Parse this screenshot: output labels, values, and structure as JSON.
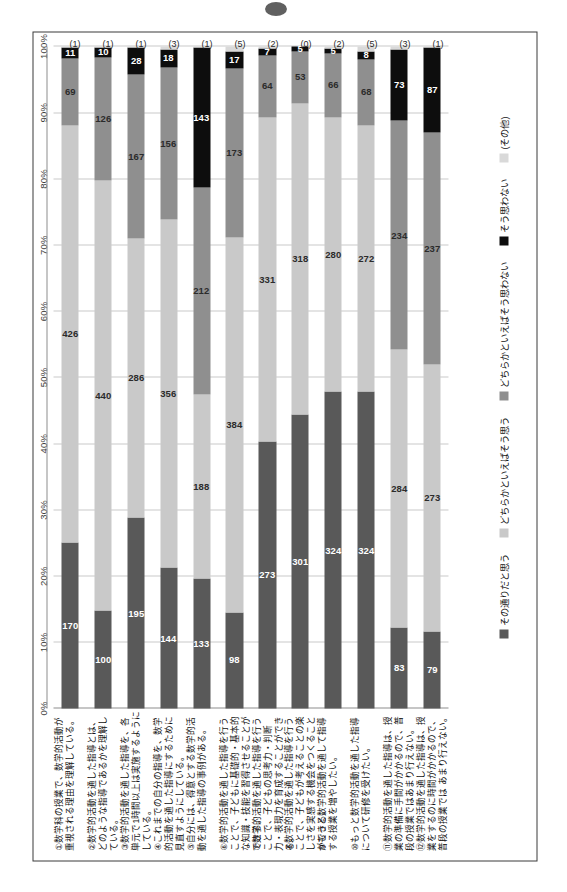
{
  "page": {
    "artifact": "punch-hole-mark"
  },
  "chart_data": {
    "type": "bar",
    "orientation": "horizontal-stacked-100",
    "title": "",
    "subtitle": "",
    "xlabel": "",
    "ylabel": "",
    "grid": true,
    "legend_position": "bottom",
    "xlim": [
      0,
      100
    ],
    "xticks": [
      "0%",
      "10%",
      "20%",
      "30%",
      "40%",
      "50%",
      "60%",
      "70%",
      "80%",
      "90%",
      "100%"
    ],
    "series": [
      {
        "name": "その通りだと思う",
        "color": "#595959"
      },
      {
        "name": "どちらかといえばそう思う",
        "color": "#c9c9c9"
      },
      {
        "name": "どちらかといえばそう思わない",
        "color": "#8f8f8f"
      },
      {
        "name": "そう思わない",
        "color": "#0d0d0d"
      },
      {
        "name": "(その他)",
        "color": "#d9d9d9"
      }
    ],
    "categories": [
      "①数学科の授業で、数学的活動が重視される理由を理解している。",
      "②数学的活動を通した指導とは、どのような指導であるかを理解している。",
      "③数学的活動を通した指導を、各単元で1時間以上は実施するようにしている。",
      "④これまでの自分の指導を、数学的活動を通した指導にするために見直すようにしている。",
      "⑤自分には、得意とする数学的活動を通した指導の事例がある。",
      "⑥数学的活動を通した指導を行うことで、子どもに基礎的・基本的な知識・技能を習得させることができる。",
      "⑦数学的活動を通した指導を行うことで、子どもの思考力・判断力・表現力を育成することができる。",
      "⑧数学的活動を通した指導を行うことで、子どもが考えることの楽しさを実感する機会をつくることができる。",
      "⑨もっと数学的活動を通して指導する授業を増やしたい。",
      "⑩もっと数学的活動を通した指導について研修を受けたい。",
      "⑪数学的活動を通した指導は、授業の準備に手間がかかるので、普段の授業ではあまり行えない。",
      "⑫数学的活動を通した指導は、授業をするのに時間がかかるので、普段の授業では あまり行えない。"
    ],
    "rows": [
      {
        "values": [
          170,
          426,
          69,
          11,
          1
        ],
        "other_label": "(1)"
      },
      {
        "values": [
          100,
          440,
          126,
          10,
          1
        ],
        "other_label": "(1)"
      },
      {
        "values": [
          195,
          286,
          167,
          28,
          1
        ],
        "other_label": "(1)"
      },
      {
        "values": [
          144,
          356,
          156,
          18,
          3
        ],
        "other_label": "(3)"
      },
      {
        "values": [
          133,
          188,
          212,
          143,
          1
        ],
        "other_label": "(1)"
      },
      {
        "values": [
          98,
          384,
          173,
          17,
          5
        ],
        "other_label": "(5)"
      },
      {
        "values": [
          273,
          331,
          64,
          7,
          2
        ],
        "other_label": "(2)"
      },
      {
        "values": [
          301,
          318,
          53,
          5,
          0
        ],
        "other_label": "(0)"
      },
      {
        "values": [
          324,
          280,
          66,
          5,
          2
        ],
        "other_label": "(2)"
      },
      {
        "values": [
          324,
          272,
          68,
          8,
          5
        ],
        "other_label": "(5)"
      },
      {
        "values": [
          83,
          284,
          234,
          73,
          3
        ],
        "other_label": "(3)"
      },
      {
        "values": [
          79,
          273,
          237,
          87,
          1
        ],
        "other_label": "(1)"
      }
    ]
  }
}
